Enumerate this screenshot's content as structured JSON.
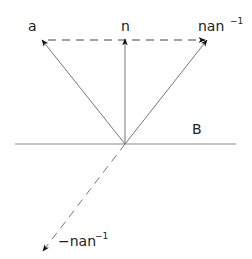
{
  "diagram": {
    "labels": {
      "a": "a",
      "n": "n",
      "nan_base": "nan",
      "nan_exp": "−1",
      "B": "B",
      "neg_nan_base": "−nan",
      "neg_nan_exp": "−1"
    },
    "colors": {
      "line": "#8a8a8a",
      "arrow": "#111111",
      "text": "#222222"
    },
    "origin": [
      125,
      144
    ]
  }
}
